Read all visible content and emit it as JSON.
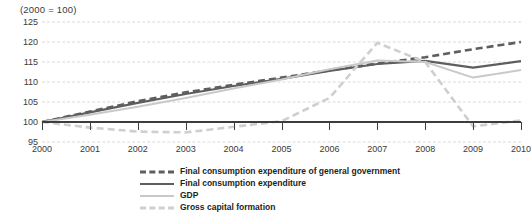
{
  "chart_data": {
    "type": "line",
    "title": "",
    "note": "(2000 = 100)",
    "xlabel": "",
    "ylabel": "",
    "categories": [
      "2000",
      "2001",
      "2002",
      "2003",
      "2004",
      "2005",
      "2006",
      "2007",
      "2008",
      "2009",
      "2010"
    ],
    "x": [
      2000,
      2001,
      2002,
      2003,
      2004,
      2005,
      2006,
      2007,
      2008,
      2009,
      2010
    ],
    "ylim": [
      95,
      125
    ],
    "yticks": [
      95,
      100,
      105,
      110,
      115,
      120,
      125
    ],
    "ytick_labels": [
      "95",
      "100",
      "105",
      "110",
      "115",
      "120",
      "125"
    ],
    "grid": true,
    "baseline_value": 100,
    "legend_position": "bottom",
    "series": [
      {
        "name": "Final consumption expenditure of general government",
        "style": "dashed",
        "color": "#5e5e5e",
        "width": 2.6,
        "values": [
          100.0,
          102.6,
          105.2,
          107.4,
          109.3,
          111.1,
          112.9,
          114.6,
          116.2,
          118.2,
          120.0
        ]
      },
      {
        "name": "Final consumption expenditure",
        "style": "solid",
        "color": "#5e5e5e",
        "width": 2.2,
        "values": [
          100.0,
          102.4,
          104.8,
          107.0,
          109.0,
          110.8,
          112.8,
          114.5,
          115.3,
          113.6,
          115.2
        ]
      },
      {
        "name": "GDP",
        "style": "solid",
        "color": "#c9c9c9",
        "width": 2.0,
        "values": [
          100.0,
          101.8,
          103.8,
          106.0,
          108.4,
          110.6,
          113.2,
          115.4,
          115.0,
          111.1,
          113.0
        ]
      },
      {
        "name": "Gross capital formation",
        "style": "dashed",
        "color": "#cfcfcf",
        "width": 2.6,
        "values": [
          100.0,
          98.6,
          97.6,
          97.4,
          98.8,
          100.2,
          106.0,
          119.8,
          115.0,
          98.9,
          100.4
        ]
      }
    ]
  },
  "legend": {
    "items": [
      {
        "label": "Final consumption expenditure of general government"
      },
      {
        "label": "Final consumption expenditure"
      },
      {
        "label": "GDP"
      },
      {
        "label": "Gross capital formation"
      }
    ]
  }
}
